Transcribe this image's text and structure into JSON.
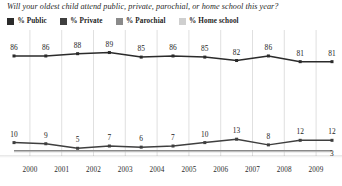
{
  "chart_data": {
    "type": "line",
    "title": "Will your oldest child attend public, private, parochial, or home school this year?",
    "xlabel": "",
    "ylabel": "",
    "ylim": [
      0,
      100
    ],
    "grid": true,
    "legend_position": "top-left",
    "categories": [
      "2000",
      "2001",
      "2002",
      "2003",
      "2004",
      "2005",
      "2006",
      "2007",
      "2008",
      "2009",
      ""
    ],
    "tick_labels": [
      "2000",
      "2001",
      "2002",
      "2003",
      "2004",
      "2005",
      "2006",
      "2007",
      "2008",
      "2009"
    ],
    "series": [
      {
        "name": "% Public",
        "color": "#2b2b2b",
        "values": [
          86,
          86,
          88,
          89,
          85,
          86,
          85,
          82,
          86,
          81,
          81
        ],
        "labels": [
          "86",
          "86",
          "88",
          "89",
          "85",
          "86",
          "85",
          "82",
          "86",
          "81",
          "81"
        ]
      },
      {
        "name": "% Private",
        "color": "#3f3f3f",
        "values": [
          10,
          9,
          5,
          7,
          6,
          7,
          10,
          13,
          8,
          12,
          12
        ],
        "labels": [
          "10",
          "9",
          "5",
          "7",
          "6",
          "7",
          "10",
          "13",
          "8",
          "12",
          "12"
        ]
      },
      {
        "name": "% Parochial",
        "color": "#8a8a8a",
        "values": [
          3,
          3,
          3,
          3,
          3,
          3,
          3,
          3,
          3,
          3,
          3
        ],
        "labels": [
          "",
          "",
          "",
          "",
          "",
          "",
          "",
          "",
          "",
          "",
          "3"
        ]
      },
      {
        "name": "% Home school",
        "color": "#c0c0c0",
        "values": [
          2,
          2,
          2,
          2,
          2,
          2,
          2,
          2,
          2,
          2,
          2
        ],
        "labels": [
          "",
          "",
          "",
          "",
          "",
          "",
          "",
          "",
          "",
          "",
          ""
        ]
      }
    ]
  },
  "legend": {
    "items": [
      {
        "label": "% Public",
        "color": "#2b2b2b"
      },
      {
        "label": "% Private",
        "color": "#3f3f3f"
      },
      {
        "label": "% Parochial",
        "color": "#8a8a8a"
      },
      {
        "label": "% Home school",
        "color": "#cfcfcf"
      }
    ]
  }
}
